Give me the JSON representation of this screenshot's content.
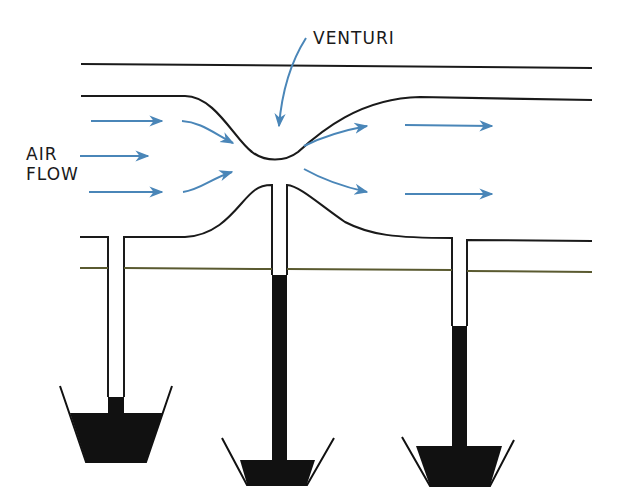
{
  "diagram": {
    "title_label": "VENTURI",
    "airflow_label_line1": "AIR",
    "airflow_label_line2": "FLOW",
    "colors": {
      "line": "#1a1a1a",
      "arrow": "#4a86b8",
      "liquid": "#111111",
      "ground_line": "#5a5a30"
    },
    "tubes": [
      {
        "name": "left",
        "liquid_top_y": 397
      },
      {
        "name": "center",
        "liquid_top_y": 275
      },
      {
        "name": "right",
        "liquid_top_y": 326
      }
    ]
  }
}
